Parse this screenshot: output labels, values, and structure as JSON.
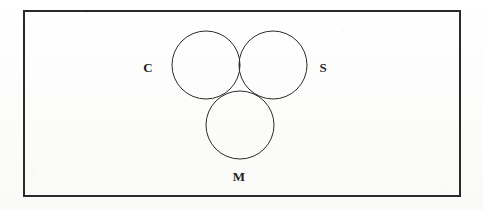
{
  "figure": {
    "kind": "venn-diagram",
    "background_color": "#fdfdfc",
    "frame": {
      "name": "outer-border-rectangle",
      "x": 24,
      "y": 11,
      "width": 436,
      "height": 185,
      "stroke_color": "#2a2a2a",
      "stroke_width": 2,
      "fill": "none"
    },
    "circles": [
      {
        "set": "C",
        "label": "C",
        "cx": 206,
        "cy": 65,
        "r": 34,
        "stroke_color": "#2b2b2b",
        "stroke_width": 1,
        "fill": "none",
        "label_x": 148,
        "label_y": 72
      },
      {
        "set": "S",
        "label": "S",
        "cx": 273,
        "cy": 65,
        "r": 34,
        "stroke_color": "#2b2b2b",
        "stroke_width": 1,
        "fill": "none",
        "label_x": 323,
        "label_y": 72
      },
      {
        "set": "M",
        "label": "M",
        "cx": 240,
        "cy": 125,
        "r": 34,
        "stroke_color": "#2b2b2b",
        "stroke_width": 1,
        "fill": "none",
        "label_x": 239,
        "label_y": 181
      }
    ],
    "shaded_regions": [
      {
        "name": "c-intersect-s-lens",
        "description": "C ∩ S",
        "sets": [
          "C",
          "S"
        ],
        "fill_color": "#333333",
        "top_vertex_x": 240,
        "top_vertex_y": 34,
        "bottom_vertex_x": 240,
        "bottom_vertex_y": 97,
        "includes_triple_intersection": true
      }
    ],
    "labels": [
      {
        "text": "C",
        "x": 148,
        "y": 72
      },
      {
        "text": "S",
        "x": 323,
        "y": 72
      },
      {
        "text": "M",
        "x": 239,
        "y": 181
      }
    ]
  }
}
